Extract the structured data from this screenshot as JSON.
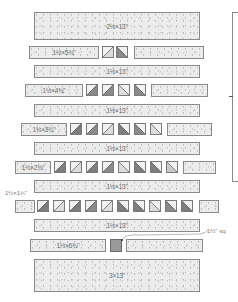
{
  "diagram": {
    "type": "quilt block cutting diagram",
    "rows": [
      {
        "id": "row1",
        "kind": "strip",
        "label": "2½×13\""
      },
      {
        "id": "row2",
        "kind": "pieced",
        "left_label": "1½×5¾\"",
        "triangles": 2
      },
      {
        "id": "row3",
        "kind": "strip",
        "label": "1½×13\""
      },
      {
        "id": "row4",
        "kind": "pieced",
        "left_label": "1½×4¾\"",
        "triangles": 4
      },
      {
        "id": "row5",
        "kind": "strip",
        "label": "1½×13\""
      },
      {
        "id": "row6",
        "kind": "pieced",
        "left_label": "1½×3¾\"",
        "triangles": 6
      },
      {
        "id": "row7",
        "kind": "strip",
        "label": "1½×13\""
      },
      {
        "id": "row8",
        "kind": "pieced",
        "left_label": "1½×2¾\"",
        "triangles": 8
      },
      {
        "id": "row9",
        "kind": "strip",
        "label": "1½×13\""
      },
      {
        "id": "row10",
        "kind": "pieced",
        "left_label": "1½×1¾\"",
        "triangles": 10
      },
      {
        "id": "row11",
        "kind": "strip",
        "label": "1½×13\""
      },
      {
        "id": "row12",
        "kind": "pieced",
        "left_label": "1½×6¾\"",
        "center": "square"
      },
      {
        "id": "row13",
        "kind": "strip",
        "label": "3×13\""
      }
    ],
    "callouts": {
      "side_label": "1½×1¾\"",
      "square_label": "1½\" sq"
    },
    "colors": {
      "dark": "#7d7d7d",
      "medium": "#a8a8a8",
      "light": "#dcdcdc",
      "background_fabric": "#ececec",
      "outline": "#8a8a8a"
    }
  }
}
